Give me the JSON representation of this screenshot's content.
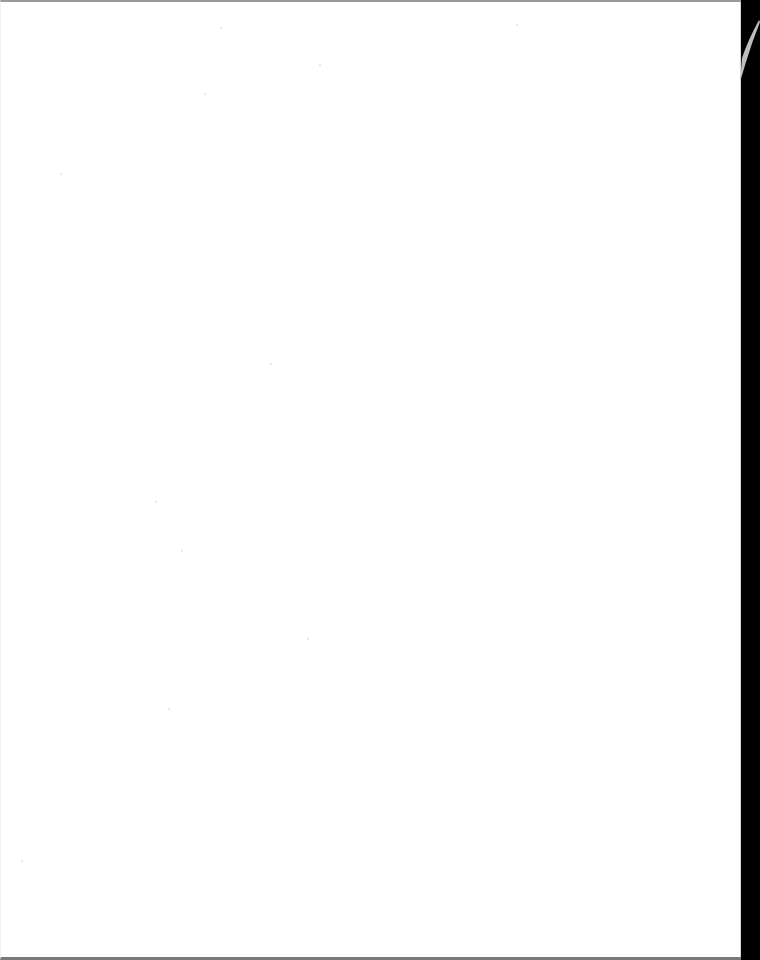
{
  "document": {
    "type": "scanned-page",
    "content": "",
    "is_blank": true
  },
  "colors": {
    "page_background": "#ffffff",
    "scan_background": "#000000",
    "scan_edge": "#7a7a7a"
  }
}
